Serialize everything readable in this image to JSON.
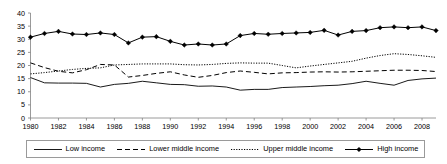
{
  "chart_data": {
    "type": "line",
    "title": "",
    "xlabel": "",
    "ylabel": "",
    "xlim": [
      1980,
      2009
    ],
    "ylim": [
      0,
      40
    ],
    "grid": false,
    "legend_position": "bottom",
    "x": [
      1980,
      1981,
      1982,
      1983,
      1984,
      1985,
      1986,
      1987,
      1988,
      1989,
      1990,
      1991,
      1992,
      1993,
      1994,
      1995,
      1996,
      1997,
      1998,
      1999,
      2000,
      2001,
      2002,
      2003,
      2004,
      2005,
      2006,
      2007,
      2008,
      2009
    ],
    "xtick_labels": [
      "1980",
      "1982",
      "1984",
      "1986",
      "1988",
      "1990",
      "1992",
      "1994",
      "1996",
      "1998",
      "2000",
      "2002",
      "2004",
      "2006",
      "2008"
    ],
    "xtick_values": [
      1980,
      1982,
      1984,
      1986,
      1988,
      1990,
      1992,
      1994,
      1996,
      1998,
      2000,
      2002,
      2004,
      2006,
      2008
    ],
    "ytick_labels": [
      "0",
      "5",
      "10",
      "15",
      "20",
      "25",
      "30",
      "35",
      "40"
    ],
    "ytick_values": [
      0,
      5,
      10,
      15,
      20,
      25,
      30,
      35,
      40
    ],
    "series": [
      {
        "name": "Low income",
        "style": "solid",
        "marker": "none",
        "color": "#000000",
        "values": [
          15.4,
          13.4,
          13.3,
          13.3,
          13.2,
          11.8,
          12.8,
          13.2,
          14.0,
          13.4,
          12.8,
          12.7,
          12.1,
          12.2,
          11.8,
          10.6,
          10.9,
          10.9,
          11.6,
          11.8,
          12.0,
          12.3,
          12.5,
          13.1,
          14.0,
          13.2,
          12.5,
          14.3,
          14.9,
          15.2
        ]
      },
      {
        "name": "Lower middle income",
        "style": "dashed",
        "marker": "none",
        "color": "#000000",
        "values": [
          21.0,
          19.2,
          17.8,
          17.2,
          18.4,
          20.4,
          20.2,
          15.6,
          16.2,
          17.0,
          17.6,
          16.4,
          15.5,
          16.2,
          17.3,
          17.9,
          17.4,
          16.8,
          17.2,
          17.3,
          17.5,
          17.6,
          17.5,
          17.6,
          17.8,
          18.0,
          18.2,
          18.2,
          18.1,
          17.7
        ]
      },
      {
        "name": "Upper middle income",
        "style": "dotted",
        "marker": "none",
        "color": "#000000",
        "values": [
          16.8,
          17.3,
          17.9,
          18.5,
          18.9,
          19.1,
          20.2,
          20.4,
          20.6,
          20.6,
          20.6,
          20.3,
          20.2,
          20.4,
          20.8,
          21.0,
          20.9,
          20.9,
          20.0,
          19.1,
          19.8,
          20.4,
          21.0,
          21.6,
          22.8,
          23.8,
          24.5,
          24.2,
          23.7,
          23.1
        ]
      },
      {
        "name": "High income",
        "style": "solid",
        "marker": "diamond",
        "color": "#000000",
        "values": [
          30.8,
          32.2,
          33.0,
          32.0,
          31.8,
          32.4,
          31.8,
          28.6,
          30.8,
          31.0,
          29.2,
          27.8,
          28.2,
          27.8,
          28.2,
          31.4,
          32.2,
          31.9,
          32.2,
          32.4,
          32.6,
          33.4,
          31.6,
          33.0,
          33.3,
          34.4,
          34.7,
          34.4,
          34.7,
          33.3
        ]
      }
    ]
  },
  "legend": {
    "items": [
      {
        "label": "Low income",
        "swatch": "solid-line-swatch"
      },
      {
        "label": "Lower middle income",
        "swatch": "dashed-line-swatch"
      },
      {
        "label": "Upper middle income",
        "swatch": "dotted-line-swatch"
      },
      {
        "label": "High income",
        "swatch": "diamond-marker-line-swatch"
      }
    ]
  }
}
